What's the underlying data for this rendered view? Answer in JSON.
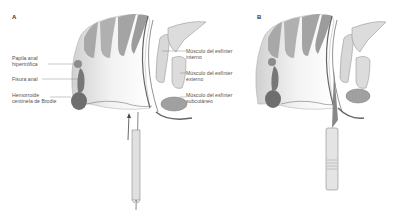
{
  "panels": [
    {
      "letter": "A"
    },
    {
      "letter": "B"
    }
  ],
  "left_labels": [
    {
      "line1": "Papila anal",
      "line2": "hipertrófica"
    },
    {
      "line1": "Fisura anal",
      "line2": ""
    },
    {
      "line1": "Hemorroide",
      "line2": "centinela de Brodie"
    }
  ],
  "right_labels": [
    {
      "line1": "Músculo del esfínter",
      "line2": "interno"
    },
    {
      "line1": "Músculo del esfínter",
      "line2": "externo"
    },
    {
      "line1": "Músculo del esfínter",
      "line2": "subcutáneo"
    }
  ],
  "colors": {
    "tissue_dark": "#8a8a8a",
    "tissue_mid": "#b5b5b5",
    "tissue_light": "#dcdcdc",
    "lesion": "#6e6e6e",
    "line": "#555555"
  }
}
